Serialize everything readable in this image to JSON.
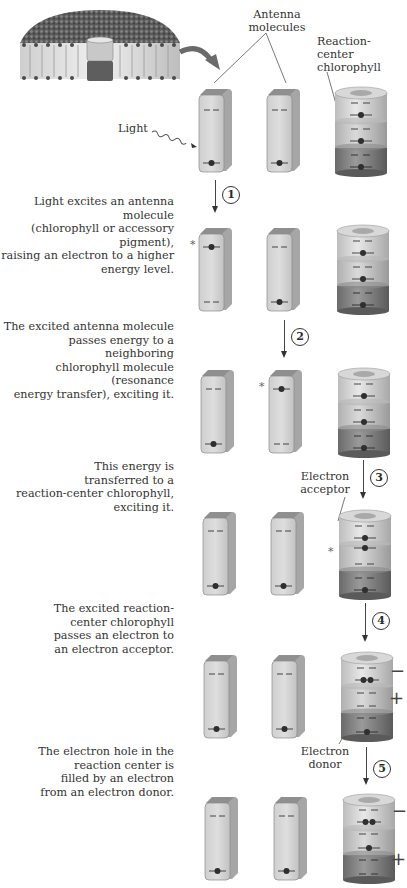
{
  "labels": {
    "antenna": "Antenna\nmolecules",
    "reaction_center": "Reaction-\ncenter\nchlorophyll",
    "light": "Light",
    "electron_acceptor": "Electron\nacceptor",
    "electron_donor": "Electron\ndonor"
  },
  "steps": [
    {
      "number": "1",
      "caption": "Light excites an antenna molecule\n(chlorophyll or accessory pigment),\nraising an electron to a higher\nenergy level."
    },
    {
      "number": "2",
      "caption": "The excited antenna molecule\npasses energy to a neighboring\nchlorophyll molecule (resonance\nenergy transfer), exciting it."
    },
    {
      "number": "3",
      "caption": "This energy is\ntransferred to a\nreaction-center chlorophyll,\nexciting it."
    },
    {
      "number": "4",
      "caption": "The excited reaction-\ncenter chlorophyll\npasses an electron to\nan electron acceptor."
    },
    {
      "number": "5",
      "caption": "The electron hole in the\nreaction center is\nfilled by an electron\nfrom an electron donor."
    }
  ],
  "symbols": {
    "excited": "*",
    "minus": "−",
    "plus": "+"
  },
  "colors": {
    "slab_face": "#d4d4d4",
    "slab_side": "#a6a6a6",
    "slab_top": "#8f8f8f",
    "cyl_light": "#d9d9d9",
    "cyl_mid": "#c4c4c4",
    "cyl_dark": "#808080",
    "electron": "#2f2f2f"
  }
}
